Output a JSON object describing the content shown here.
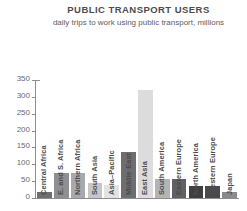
{
  "chart_data": {
    "type": "bar",
    "title": "PUBLIC TRANSPORT USERS",
    "subtitle": "daily trips to work using public transport, millions",
    "xlabel": "",
    "ylabel": "",
    "ylim": [
      0,
      350
    ],
    "yticks": [
      0,
      50,
      100,
      150,
      200,
      250,
      300,
      350
    ],
    "grid": false,
    "legend": "none",
    "categories": [
      "Central Africa",
      "E. and S. Africa",
      "Northern Africa",
      "South Asia",
      "Asia–Pacific",
      "Middle East",
      "East Asia",
      "South America",
      "Eastern Europe",
      "North America",
      "Western Europe",
      "Japan"
    ],
    "values": [
      18,
      75,
      75,
      45,
      40,
      137,
      320,
      55,
      55,
      36,
      36,
      18
    ],
    "bar_colors": [
      "#6e6e70",
      "#8f8f91",
      "#a9a9ab",
      "#c6c6c8",
      "#e2e2e2",
      "#6e6e70",
      "#dcdcdc",
      "#b4b4b6",
      "#616163",
      "#3f3f41",
      "#4a4a4c",
      "#8a8a8c"
    ]
  },
  "style": {
    "background": "#ffffff",
    "axis_color": "#8d8d8f",
    "text_color": "#58585a",
    "title_color": "#4c4c4e"
  }
}
